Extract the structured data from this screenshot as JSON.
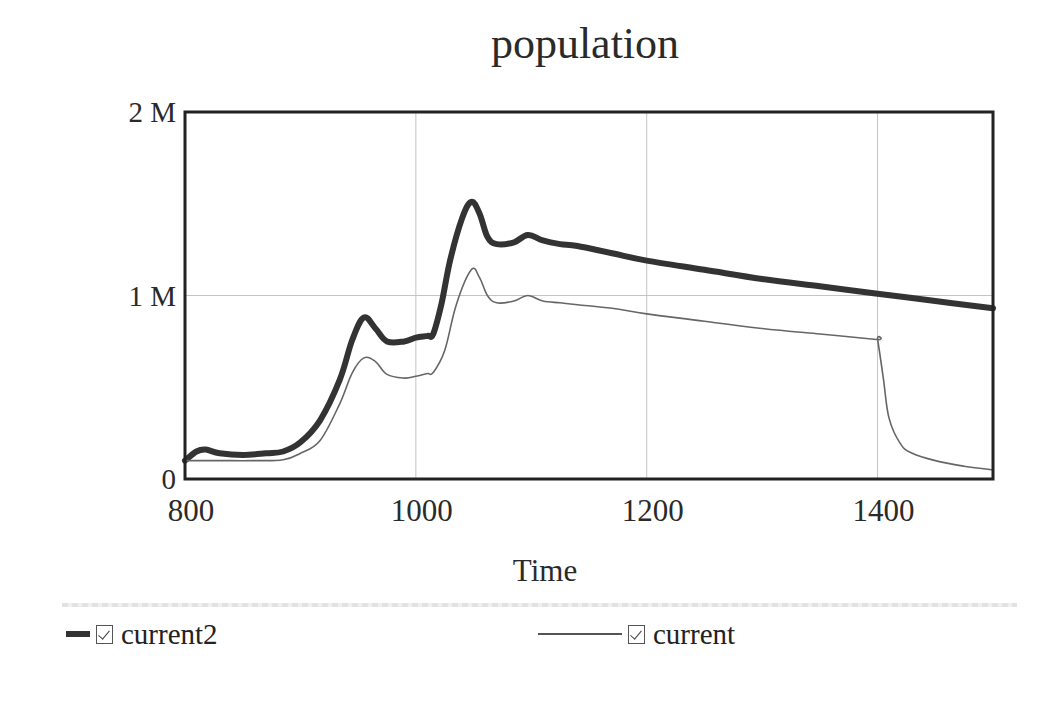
{
  "chart_data": {
    "type": "line",
    "title": "population",
    "xlabel": "Time",
    "ylabel": "",
    "xlim": [
      800,
      1500
    ],
    "ylim": [
      0,
      2000000
    ],
    "x_ticks": [
      800,
      1000,
      1200,
      1400
    ],
    "x_tick_labels": [
      "800",
      "1000",
      "1200",
      "1400"
    ],
    "y_ticks": [
      0,
      1000000,
      2000000
    ],
    "y_tick_labels": [
      "0",
      "1 M",
      "2 M"
    ],
    "grid": true,
    "legend_position": "bottom",
    "series": [
      {
        "name": "current2",
        "style": "thick",
        "color": "#333333",
        "x": [
          800,
          810,
          818,
          830,
          850,
          870,
          885,
          900,
          917,
          934,
          945,
          955,
          965,
          975,
          990,
          1000,
          1010,
          1015,
          1022,
          1030,
          1040,
          1048,
          1055,
          1062,
          1070,
          1085,
          1097,
          1110,
          1125,
          1140,
          1170,
          1200,
          1250,
          1300,
          1350,
          1400,
          1450,
          1500
        ],
        "y": [
          100000,
          150000,
          160000,
          140000,
          130000,
          140000,
          150000,
          200000,
          320000,
          540000,
          760000,
          880000,
          820000,
          750000,
          750000,
          770000,
          780000,
          790000,
          950000,
          1200000,
          1420000,
          1510000,
          1450000,
          1320000,
          1280000,
          1290000,
          1330000,
          1300000,
          1280000,
          1270000,
          1230000,
          1190000,
          1140000,
          1090000,
          1050000,
          1010000,
          970000,
          930000
        ]
      },
      {
        "name": "current",
        "style": "thin",
        "color": "#666666",
        "x": [
          800,
          830,
          860,
          885,
          900,
          917,
          934,
          945,
          955,
          965,
          975,
          990,
          1000,
          1010,
          1015,
          1025,
          1035,
          1048,
          1055,
          1062,
          1070,
          1085,
          1097,
          1110,
          1125,
          1140,
          1170,
          1200,
          1250,
          1300,
          1350,
          1399,
          1400,
          1405,
          1410,
          1420,
          1430,
          1450,
          1475,
          1500
        ],
        "y": [
          100000,
          100000,
          100000,
          105000,
          140000,
          210000,
          410000,
          580000,
          660000,
          640000,
          570000,
          550000,
          560000,
          575000,
          580000,
          700000,
          950000,
          1140000,
          1100000,
          1000000,
          960000,
          970000,
          1000000,
          970000,
          960000,
          950000,
          930000,
          900000,
          860000,
          820000,
          790000,
          760000,
          760000,
          550000,
          330000,
          190000,
          140000,
          100000,
          70000,
          50000
        ]
      }
    ]
  },
  "legend": {
    "items": [
      {
        "label": "current2",
        "checked": true
      },
      {
        "label": "current",
        "checked": true
      }
    ]
  }
}
